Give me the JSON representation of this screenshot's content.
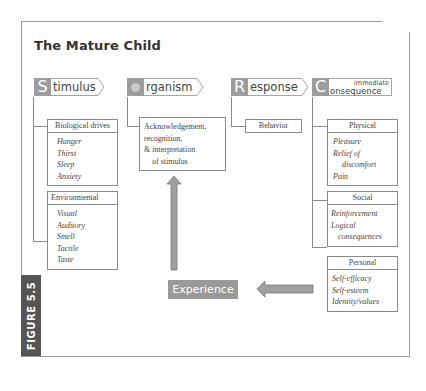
{
  "title": "The Mature Child",
  "figure_label": "FIGURE 5.5",
  "headers": [
    {
      "letter": "S",
      "rest": "timulus"
    },
    {
      "letter": "O",
      "rest": "rganism"
    },
    {
      "letter": "R",
      "rest": "esponse"
    },
    {
      "letter": "C",
      "rest_small": "immediate",
      "rest": "onsequence"
    }
  ],
  "stimulus": {
    "boxes": [
      {
        "heading": "Biological drives",
        "items": [
          "Hunger",
          "Thirst",
          "Sleep",
          "Anxiety"
        ]
      },
      {
        "heading": "Environmental",
        "items": [
          "Visual",
          "Auditory",
          "Smell",
          "Tactile",
          "Taste"
        ]
      }
    ]
  },
  "organism": {
    "lines": [
      "Acknowledgement,",
      "recognition,",
      "& interpretation",
      "of stimulus"
    ]
  },
  "response": {
    "box": "Behavior"
  },
  "consequence": {
    "boxes": [
      {
        "heading": "Physical",
        "items": [
          "Pleasure",
          "Relief of",
          "discomfort",
          "Pain"
        ]
      },
      {
        "heading": "Social",
        "items": [
          "Reinforcement",
          "Logical",
          "consequences"
        ]
      },
      {
        "heading": "Personal",
        "items": [
          "Self-efficacy",
          "Self-esteem",
          "Identity/values"
        ]
      }
    ]
  },
  "experience": "Experience",
  "colors": {
    "accent_gray": "#9d9d9d",
    "figure_label_bg": "#555555",
    "border": "#8a8a8a"
  }
}
